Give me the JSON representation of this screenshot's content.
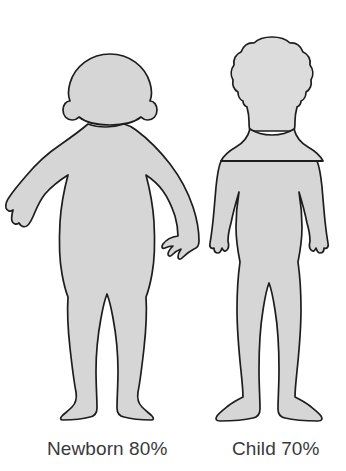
{
  "illustration": {
    "title": "Body surface area comparison",
    "background_color": "#ffffff",
    "body_fill_color": "#d6d6d6",
    "body_outline_color": "#1d1d1d",
    "text_color": "#39393b"
  },
  "figures": [
    {
      "id": "newborn",
      "caption": "Newborn 80%",
      "label_name": "Newborn",
      "percent": "80%",
      "percent_value": 80,
      "pose": "arms-outstretched-standing",
      "has_divider_line": false
    },
    {
      "id": "child",
      "caption": "Child 70%",
      "label_name": "Child",
      "percent": "70%",
      "percent_value": 70,
      "pose": "arms-at-sides-standing",
      "has_divider_line": true,
      "divider_description": "horizontal line across upper chest"
    }
  ],
  "captions": {
    "newborn": "Newborn 80%",
    "child": "Child 70%"
  }
}
